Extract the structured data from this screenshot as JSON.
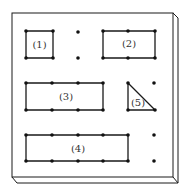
{
  "diagram": {
    "type": "board-with-pin-shapes",
    "colors": {
      "line": "#1a1a1a",
      "dot": "#111111",
      "label": "#333333",
      "background": "#ffffff"
    },
    "shapes": [
      {
        "id": 1,
        "label": "(1)",
        "kind": "square",
        "pins_per_side": 2
      },
      {
        "id": 2,
        "label": "(2)",
        "kind": "rectangle",
        "pins_long_side": 3,
        "pins_short_side": 2
      },
      {
        "id": 3,
        "label": "(3)",
        "kind": "rectangle",
        "pins_long_side": 4,
        "pins_short_side": 2
      },
      {
        "id": 4,
        "label": "(4)",
        "kind": "rectangle",
        "pins_long_side": 5,
        "pins_short_side": 2
      },
      {
        "id": 5,
        "label": "(5)",
        "kind": "right-triangle",
        "pins": 3
      }
    ],
    "labels": {
      "s1": "(1)",
      "s2": "(2)",
      "s3": "(3)",
      "s4": "(4)",
      "s5": "(5)"
    }
  }
}
